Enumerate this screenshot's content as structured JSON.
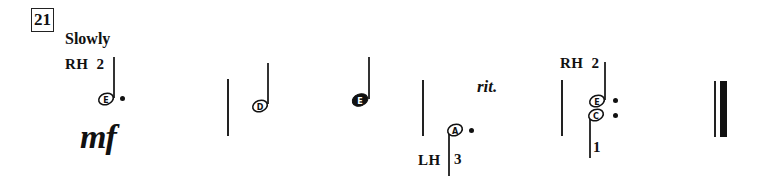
{
  "exercise": {
    "number": "21",
    "tempo": "Slowly",
    "dynamic": "mf",
    "expression": "rit."
  },
  "hands": {
    "rh_label_1": "RH",
    "rh_finger_1": "2",
    "lh_label": "LH",
    "lh_finger": "3",
    "rh_label_2": "RH",
    "rh_finger_2": "2",
    "lh_finger_2": "1"
  },
  "notes": [
    {
      "name": "E",
      "type": "dotted-half",
      "hand": "RH",
      "stem": "up"
    },
    {
      "name": "D",
      "type": "half",
      "hand": "RH",
      "stem": "up"
    },
    {
      "name": "E",
      "type": "quarter",
      "hand": "RH",
      "stem": "up"
    },
    {
      "name": "A",
      "type": "dotted-half",
      "hand": "LH",
      "stem": "down"
    },
    {
      "name": "E",
      "type": "dotted-half",
      "hand": "RH",
      "stem": "up"
    },
    {
      "name": "C",
      "type": "dotted-half",
      "hand": "LH",
      "stem": "down"
    }
  ],
  "note_labels": {
    "n1": "E",
    "n2": "D",
    "n3": "E",
    "n4": "A",
    "n5": "E",
    "n6": "C"
  },
  "colors": {
    "ink": "#111111",
    "background": "#ffffff"
  }
}
